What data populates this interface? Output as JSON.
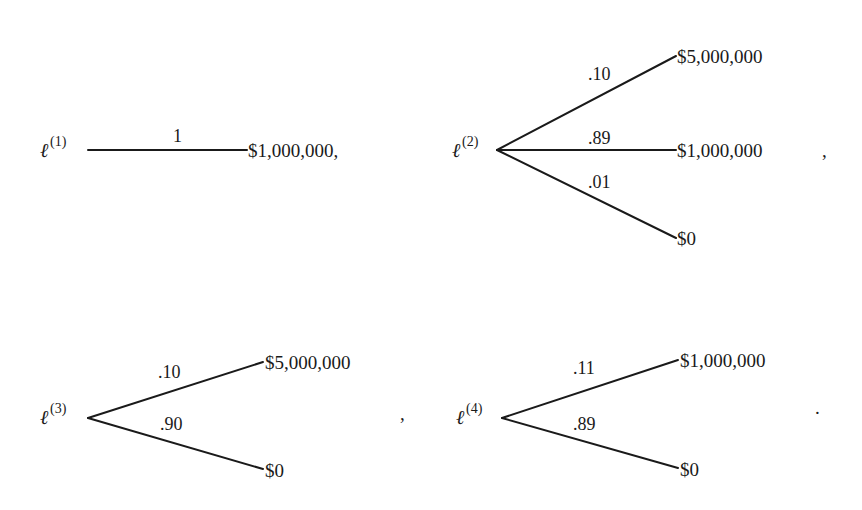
{
  "diagram": {
    "type": "lottery-trees",
    "lotteries": [
      {
        "id": "lottery-1",
        "symbol": "ℓ",
        "index": "(1)",
        "trailing_punct": "",
        "branches": [
          {
            "prob": "1",
            "outcome": "$1,000,000,"
          }
        ]
      },
      {
        "id": "lottery-2",
        "symbol": "ℓ",
        "index": "(2)",
        "trailing_punct": ",",
        "branches": [
          {
            "prob": ".10",
            "outcome": "$5,000,000"
          },
          {
            "prob": ".89",
            "outcome": "$1,000,000"
          },
          {
            "prob": ".01",
            "outcome": "$0"
          }
        ]
      },
      {
        "id": "lottery-3",
        "symbol": "ℓ",
        "index": "(3)",
        "trailing_punct": ",",
        "branches": [
          {
            "prob": ".10",
            "outcome": "$5,000,000"
          },
          {
            "prob": ".90",
            "outcome": "$0"
          }
        ]
      },
      {
        "id": "lottery-4",
        "symbol": "ℓ",
        "index": "(4)",
        "trailing_punct": ".",
        "branches": [
          {
            "prob": ".11",
            "outcome": "$1,000,000"
          },
          {
            "prob": ".89",
            "outcome": "$0"
          }
        ]
      }
    ]
  }
}
